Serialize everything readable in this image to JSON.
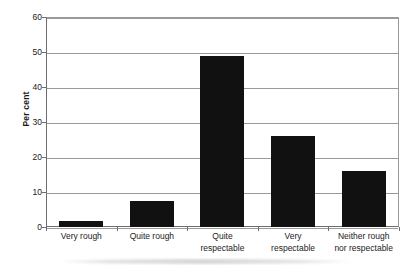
{
  "chart_data": {
    "type": "bar",
    "title": "",
    "xlabel": "",
    "ylabel": "Per cent",
    "categories": [
      "Very rough",
      "Quite rough",
      "Quite respectable",
      "Very respectable",
      "Neither rough nor respectable"
    ],
    "category_lines": [
      [
        "Very rough"
      ],
      [
        "Quite rough"
      ],
      [
        "Quite",
        "respectable"
      ],
      [
        "Very",
        "respectable"
      ],
      [
        "Neither rough",
        "nor respectable"
      ]
    ],
    "values": [
      1.7,
      7.5,
      49.0,
      26.0,
      16.0
    ],
    "ylim": [
      0,
      60
    ],
    "yticks": [
      0,
      10,
      20,
      30,
      40,
      50,
      60
    ],
    "ytick_labels": [
      "0",
      "10",
      "20",
      "30",
      "40",
      "50",
      "60"
    ],
    "grid": true,
    "legend": false,
    "bar_color": "#111111",
    "gridline_color": "#9a9a9a",
    "axis_color": "#6e6e6e",
    "background_color": "#ffffff"
  }
}
